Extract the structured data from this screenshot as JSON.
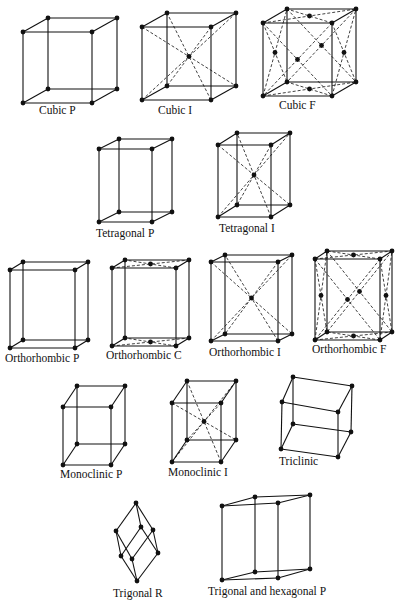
{
  "figure": {
    "cells": [
      {
        "id": "cubic-p",
        "label": "Cubic P",
        "system": "Cubic",
        "centering": "P"
      },
      {
        "id": "cubic-i",
        "label": "Cubic I",
        "system": "Cubic",
        "centering": "I"
      },
      {
        "id": "cubic-f",
        "label": "Cubic F",
        "system": "Cubic",
        "centering": "F"
      },
      {
        "id": "tetragonal-p",
        "label": "Tetragonal P",
        "system": "Tetragonal",
        "centering": "P"
      },
      {
        "id": "tetragonal-i",
        "label": "Tetragonal I",
        "system": "Tetragonal",
        "centering": "I"
      },
      {
        "id": "orthorhombic-p",
        "label": "Orthorhombic P",
        "system": "Orthorhombic",
        "centering": "P"
      },
      {
        "id": "orthorhombic-c",
        "label": "Orthorhombic C",
        "system": "Orthorhombic",
        "centering": "C"
      },
      {
        "id": "orthorhombic-i",
        "label": "Orthorhombic I",
        "system": "Orthorhombic",
        "centering": "I"
      },
      {
        "id": "orthorhombic-f",
        "label": "Orthorhombic F",
        "system": "Orthorhombic",
        "centering": "F"
      },
      {
        "id": "monoclinic-p",
        "label": "Monoclinic P",
        "system": "Monoclinic",
        "centering": "P"
      },
      {
        "id": "monoclinic-i",
        "label": "Monoclinic I",
        "system": "Monoclinic",
        "centering": "I"
      },
      {
        "id": "triclinic",
        "label": "Triclinic",
        "system": "Triclinic",
        "centering": "P"
      },
      {
        "id": "trigonal-r",
        "label": "Trigonal R",
        "system": "Trigonal",
        "centering": "R"
      },
      {
        "id": "hexagonal-p",
        "label": "Trigonal and hexagonal P",
        "system": "Hexagonal",
        "centering": "P"
      }
    ]
  },
  "colors": {
    "line": "#111111",
    "background": "#ffffff"
  }
}
